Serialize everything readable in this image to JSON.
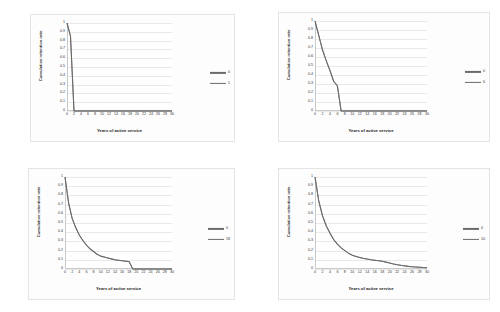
{
  "figure": {
    "layout": "2x2-grid",
    "panel_count": 4,
    "background_color": "#ffffff"
  },
  "style": {
    "line_color": "#6b6b6b",
    "gridline_color": "#e9e9e9",
    "axis_color": "#c9c9c9",
    "panel_border_color": "#e4e4e4",
    "panel_background": "#fdfdfd",
    "text_color": "#333333"
  },
  "chart_data": [
    {
      "type": "line",
      "title": "",
      "xlabel": "Years of active service",
      "ylabel": "Cumulative retention rate",
      "xlim": [
        0,
        30
      ],
      "ylim": [
        0,
        1
      ],
      "xticks": [
        0,
        2,
        4,
        6,
        8,
        10,
        12,
        14,
        16,
        18,
        20,
        22,
        24,
        26,
        28,
        30
      ],
      "yticks": [
        0,
        0.1,
        0.2,
        0.3,
        0.4,
        0.5,
        0.6,
        0.7,
        0.8,
        0.9,
        1
      ],
      "grid": true,
      "legend_position": "right",
      "legend": [
        "0",
        "1"
      ],
      "series": [
        {
          "name": "0",
          "x": [
            0,
            1,
            2,
            3,
            4,
            6,
            8,
            10,
            12,
            14,
            16,
            18,
            20,
            22,
            24,
            26,
            28,
            30
          ],
          "values": [
            1,
            0.85,
            0.0,
            0.0,
            0.0,
            0.0,
            0.0,
            0.0,
            0.0,
            0.0,
            0.0,
            0.0,
            0.0,
            0.0,
            0.0,
            0.0,
            0.0,
            0.0
          ]
        },
        {
          "name": "1",
          "x": [
            0,
            1,
            2,
            3,
            4,
            6,
            8,
            10,
            12,
            14,
            16,
            18,
            20,
            22,
            24,
            26,
            28,
            30
          ],
          "values": [
            1,
            0.85,
            0.0,
            0.0,
            0.0,
            0.0,
            0.0,
            0.0,
            0.0,
            0.0,
            0.0,
            0.0,
            0.0,
            0.0,
            0.0,
            0.0,
            0.0,
            0.0
          ]
        }
      ]
    },
    {
      "type": "line",
      "title": "",
      "xlabel": "Years of active service",
      "ylabel": "Cumulative retention rate",
      "xlim": [
        0,
        30
      ],
      "ylim": [
        0,
        1
      ],
      "xticks": [
        0,
        2,
        4,
        6,
        8,
        10,
        12,
        14,
        16,
        18,
        20,
        22,
        24,
        26,
        28,
        30
      ],
      "yticks": [
        0,
        0.1,
        0.2,
        0.3,
        0.4,
        0.5,
        0.6,
        0.7,
        0.8,
        0.9,
        1
      ],
      "grid": true,
      "legend_position": "right",
      "legend": [
        "0",
        "6"
      ],
      "series": [
        {
          "name": "0",
          "x": [
            0,
            1,
            2,
            3,
            4,
            5,
            6,
            7,
            8,
            10,
            12,
            14,
            16,
            18,
            20,
            22,
            24,
            26,
            28,
            30
          ],
          "values": [
            1,
            0.84,
            0.68,
            0.56,
            0.45,
            0.33,
            0.28,
            0.0,
            0.0,
            0.0,
            0.0,
            0.0,
            0.0,
            0.0,
            0.0,
            0.0,
            0.0,
            0.0,
            0.0,
            0.0
          ]
        },
        {
          "name": "6",
          "x": [
            0,
            1,
            2,
            3,
            4,
            5,
            6,
            7,
            8,
            10,
            12,
            14,
            16,
            18,
            20,
            22,
            24,
            26,
            28,
            30
          ],
          "values": [
            1,
            0.84,
            0.68,
            0.56,
            0.45,
            0.33,
            0.28,
            0.0,
            0.0,
            0.0,
            0.0,
            0.0,
            0.0,
            0.0,
            0.0,
            0.0,
            0.0,
            0.0,
            0.0,
            0.0
          ]
        }
      ]
    },
    {
      "type": "line",
      "title": "",
      "xlabel": "Years of active service",
      "ylabel": "Cumulative retention rate",
      "xlim": [
        0,
        30
      ],
      "ylim": [
        0,
        1
      ],
      "xticks": [
        0,
        2,
        4,
        6,
        8,
        10,
        12,
        14,
        16,
        18,
        20,
        22,
        24,
        26,
        28,
        30
      ],
      "yticks": [
        0,
        0.1,
        0.2,
        0.3,
        0.4,
        0.5,
        0.6,
        0.7,
        0.8,
        0.9,
        1
      ],
      "grid": true,
      "legend_position": "right",
      "legend": [
        "0",
        "18"
      ],
      "series": [
        {
          "name": "0",
          "x": [
            0,
            1,
            2,
            3,
            4,
            5,
            6,
            7,
            8,
            9,
            10,
            11,
            12,
            13,
            14,
            15,
            16,
            17,
            18,
            19,
            20,
            22,
            24,
            26,
            28,
            30
          ],
          "values": [
            1,
            0.72,
            0.55,
            0.45,
            0.37,
            0.31,
            0.26,
            0.22,
            0.19,
            0.16,
            0.14,
            0.13,
            0.12,
            0.11,
            0.1,
            0.095,
            0.09,
            0.085,
            0.08,
            0.0,
            0.0,
            0.0,
            0.0,
            0.0,
            0.0,
            0.0
          ]
        },
        {
          "name": "18",
          "x": [
            0,
            1,
            2,
            3,
            4,
            5,
            6,
            7,
            8,
            9,
            10,
            11,
            12,
            13,
            14,
            15,
            16,
            17,
            18,
            19,
            20,
            22,
            24,
            26,
            28,
            30
          ],
          "values": [
            1,
            0.72,
            0.55,
            0.45,
            0.37,
            0.31,
            0.26,
            0.22,
            0.19,
            0.16,
            0.14,
            0.13,
            0.12,
            0.11,
            0.1,
            0.095,
            0.09,
            0.085,
            0.08,
            0.0,
            0.0,
            0.0,
            0.0,
            0.0,
            0.0,
            0.0
          ]
        }
      ]
    },
    {
      "type": "line",
      "title": "",
      "xlabel": "Years of active service",
      "ylabel": "Cumulative retention rate",
      "xlim": [
        0,
        30
      ],
      "ylim": [
        0,
        1
      ],
      "xticks": [
        0,
        2,
        4,
        6,
        8,
        10,
        12,
        14,
        16,
        18,
        20,
        22,
        24,
        26,
        28,
        30
      ],
      "yticks": [
        0,
        0.1,
        0.2,
        0.3,
        0.4,
        0.5,
        0.6,
        0.7,
        0.8,
        0.9,
        1
      ],
      "grid": true,
      "legend_position": "right",
      "legend": [
        "0",
        "10"
      ],
      "series": [
        {
          "name": "0",
          "x": [
            0,
            1,
            2,
            3,
            4,
            5,
            6,
            7,
            8,
            9,
            10,
            11,
            12,
            13,
            14,
            15,
            16,
            17,
            18,
            19,
            20,
            21,
            22,
            23,
            24,
            25,
            26,
            27,
            28,
            29,
            30
          ],
          "values": [
            1,
            0.74,
            0.58,
            0.47,
            0.39,
            0.32,
            0.27,
            0.23,
            0.2,
            0.17,
            0.15,
            0.135,
            0.125,
            0.115,
            0.108,
            0.1,
            0.095,
            0.09,
            0.085,
            0.075,
            0.065,
            0.055,
            0.047,
            0.04,
            0.034,
            0.029,
            0.025,
            0.022,
            0.019,
            0.016,
            0.014
          ]
        },
        {
          "name": "10",
          "x": [
            0,
            1,
            2,
            3,
            4,
            5,
            6,
            7,
            8,
            9,
            10,
            11,
            12,
            13,
            14,
            15,
            16,
            17,
            18,
            19,
            20,
            21,
            22,
            23,
            24,
            25,
            26,
            27,
            28,
            29,
            30
          ],
          "values": [
            1,
            0.74,
            0.58,
            0.47,
            0.39,
            0.32,
            0.27,
            0.23,
            0.2,
            0.17,
            0.15,
            0.135,
            0.125,
            0.115,
            0.108,
            0.1,
            0.095,
            0.09,
            0.085,
            0.075,
            0.065,
            0.055,
            0.047,
            0.04,
            0.034,
            0.029,
            0.025,
            0.022,
            0.019,
            0.016,
            0.014
          ]
        }
      ]
    }
  ]
}
